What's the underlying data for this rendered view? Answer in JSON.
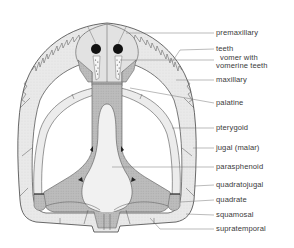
{
  "figure": {
    "colors": {
      "background": "#ffffff",
      "outline": "#444444",
      "bone_light": "#ececec",
      "bone_mid": "#d6d6d6",
      "bone_dark": "#a8a8a8",
      "leader_line": "#777777",
      "label_text": "#3a3a3a"
    },
    "labels": [
      {
        "id": "premaxillary",
        "text": "premaxillary",
        "x": 216,
        "y": 29
      },
      {
        "id": "teeth",
        "text": "teeth",
        "x": 216,
        "y": 45
      },
      {
        "id": "vomer",
        "text": "vomer with",
        "text2": "vomerine teeth",
        "x": 216,
        "y": 55
      },
      {
        "id": "maxillary",
        "text": "maxillary",
        "x": 216,
        "y": 76
      },
      {
        "id": "palatine",
        "text": "palatine",
        "x": 216,
        "y": 99
      },
      {
        "id": "pterygoid",
        "text": "pterygoid",
        "x": 216,
        "y": 124
      },
      {
        "id": "jugal",
        "text": "jugal (malar)",
        "x": 216,
        "y": 144
      },
      {
        "id": "parasphenoid",
        "text": "parasphenoid",
        "x": 216,
        "y": 163
      },
      {
        "id": "quadratojugal",
        "text": "quadratojugal",
        "x": 216,
        "y": 181
      },
      {
        "id": "quadrate",
        "text": "quadrate",
        "x": 216,
        "y": 196
      },
      {
        "id": "squamosal",
        "text": "squamosal",
        "x": 216,
        "y": 211
      },
      {
        "id": "supratemporal",
        "text": "supratemporal",
        "x": 216,
        "y": 225
      }
    ]
  }
}
